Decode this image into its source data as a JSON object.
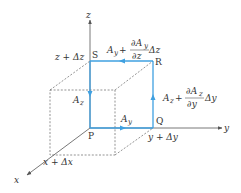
{
  "figure": {
    "axes": {
      "x_label": "x",
      "y_label": "y",
      "z_label": "z"
    },
    "points": {
      "P": "P",
      "Q": "Q",
      "R": "R",
      "S": "S"
    },
    "ticks": {
      "x_plus": "x + Δx",
      "y_plus": "y + Δy",
      "z_plus": "z + Δz"
    },
    "edge_labels": {
      "PQ": "A",
      "PQ_sub": "y",
      "SP": "A",
      "SP_sub": "z",
      "QR_main": "A",
      "QR_sub": "z",
      "QR_plus": "+",
      "QR_num": "∂A",
      "QR_num_sub": "z",
      "QR_den": "∂y",
      "QR_tail": "Δy",
      "RS_main": "A",
      "RS_sub": "y",
      "RS_plus": "+",
      "RS_num": "∂A",
      "RS_num_sub": "y",
      "RS_den": "∂z",
      "RS_tail": "Δz"
    },
    "colors": {
      "loop": "#3fa0e0",
      "axis": "#555555",
      "dashed": "#555555"
    }
  }
}
